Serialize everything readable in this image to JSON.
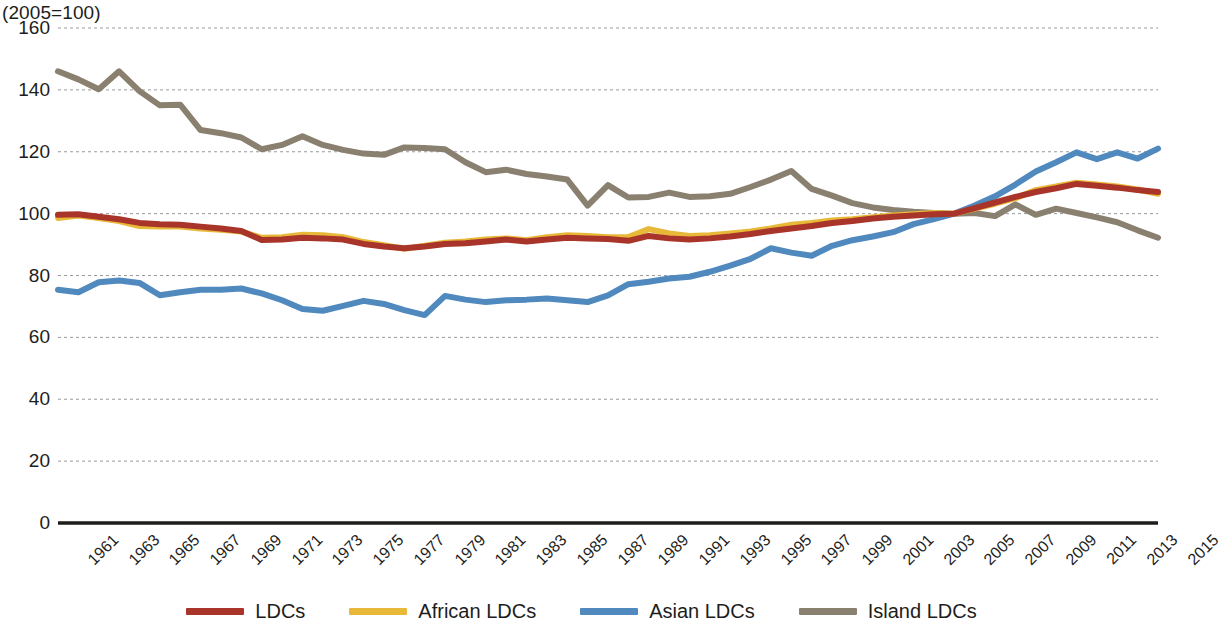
{
  "chart_data": {
    "type": "line",
    "title": "(2005=100)",
    "xlabel": "",
    "ylabel": "",
    "ylim": [
      0,
      160
    ],
    "ytick_step": 20,
    "yticks": [
      160,
      140,
      120,
      100,
      80,
      60,
      40,
      20,
      0
    ],
    "grid": true,
    "grid_style": "dotted-horizontal",
    "legend_position": "bottom-center",
    "x": [
      1961,
      1962,
      1963,
      1964,
      1965,
      1966,
      1967,
      1968,
      1969,
      1970,
      1971,
      1972,
      1973,
      1974,
      1975,
      1976,
      1977,
      1978,
      1979,
      1980,
      1981,
      1982,
      1983,
      1984,
      1985,
      1986,
      1987,
      1988,
      1989,
      1990,
      1991,
      1992,
      1993,
      1994,
      1995,
      1996,
      1997,
      1998,
      1999,
      2000,
      2001,
      2002,
      2003,
      2004,
      2005,
      2006,
      2007,
      2008,
      2009,
      2010,
      2011,
      2012,
      2013,
      2014,
      2015
    ],
    "xtick_labels": [
      1961,
      1963,
      1965,
      1967,
      1969,
      1971,
      1973,
      1975,
      1977,
      1979,
      1981,
      1983,
      1985,
      1987,
      1989,
      1991,
      1993,
      1995,
      1997,
      1999,
      2001,
      2003,
      2005,
      2007,
      2009,
      2011,
      2013,
      2015
    ],
    "series": [
      {
        "name": "LDCs",
        "color": "#A8342A",
        "values": [
          99.6,
          99.8,
          99.0,
          98.2,
          97.0,
          96.6,
          96.4,
          95.8,
          95.2,
          94.4,
          91.5,
          91.6,
          92.2,
          92.0,
          91.6,
          90.2,
          89.4,
          88.8,
          89.4,
          90.2,
          90.4,
          91.0,
          91.6,
          91.0,
          91.6,
          92.2,
          92.0,
          91.8,
          91.2,
          92.8,
          92.0,
          91.6,
          92.0,
          92.6,
          93.4,
          94.4,
          95.2,
          96.0,
          97.0,
          97.6,
          98.4,
          99.0,
          99.4,
          99.8,
          100.0,
          101.8,
          103.6,
          105.4,
          107.0,
          108.2,
          109.6,
          109.0,
          108.4,
          107.6,
          107.0
        ]
      },
      {
        "name": "African LDCs",
        "color": "#E8B838",
        "values": [
          98.6,
          99.4,
          98.6,
          97.6,
          96.0,
          95.8,
          95.8,
          95.2,
          94.8,
          94.2,
          92.2,
          92.4,
          93.2,
          93.0,
          92.4,
          90.8,
          89.8,
          88.6,
          89.6,
          90.6,
          91.0,
          91.6,
          92.0,
          91.4,
          92.4,
          93.0,
          92.8,
          92.4,
          92.4,
          95.0,
          93.6,
          92.8,
          93.0,
          93.6,
          94.2,
          95.2,
          96.4,
          97.0,
          97.8,
          98.2,
          98.8,
          99.4,
          99.8,
          100.2,
          100.0,
          101.6,
          103.2,
          105.0,
          107.6,
          108.8,
          110.0,
          109.4,
          108.8,
          107.8,
          106.4
        ]
      },
      {
        "name": "Asian LDCs",
        "color": "#5089BE",
        "values": [
          75.4,
          74.6,
          77.8,
          78.4,
          77.6,
          73.6,
          74.6,
          75.4,
          75.4,
          75.8,
          74.2,
          72.0,
          69.2,
          68.6,
          70.2,
          71.8,
          70.8,
          68.8,
          67.2,
          73.4,
          72.2,
          71.4,
          72.0,
          72.2,
          72.6,
          72.0,
          71.4,
          73.6,
          77.2,
          78.0,
          79.0,
          79.6,
          81.2,
          83.2,
          85.4,
          88.8,
          87.4,
          86.4,
          89.6,
          91.4,
          92.6,
          94.0,
          96.6,
          98.2,
          100.0,
          102.6,
          105.6,
          109.4,
          113.6,
          116.6,
          119.8,
          117.6,
          119.8,
          117.8,
          121.0
        ]
      },
      {
        "name": "Island LDCs",
        "color": "#8A8070",
        "values": [
          146.0,
          143.4,
          140.2,
          146.0,
          139.6,
          135.0,
          135.2,
          127.0,
          126.0,
          124.6,
          120.8,
          122.2,
          125.0,
          122.2,
          120.6,
          119.4,
          119.0,
          121.4,
          121.2,
          120.8,
          116.6,
          113.4,
          114.2,
          112.8,
          112.0,
          111.0,
          102.6,
          109.2,
          105.2,
          105.4,
          106.8,
          105.4,
          105.6,
          106.4,
          108.6,
          111.0,
          113.8,
          108.0,
          105.8,
          103.4,
          102.0,
          101.2,
          100.6,
          100.2,
          100.0,
          100.2,
          99.2,
          103.0,
          99.6,
          101.6,
          100.2,
          98.8,
          97.2,
          94.6,
          92.2
        ]
      }
    ]
  },
  "legend": {
    "items": [
      {
        "label": "LDCs",
        "color": "#A8342A"
      },
      {
        "label": "African LDCs",
        "color": "#E8B838"
      },
      {
        "label": "Asian LDCs",
        "color": "#5089BE"
      },
      {
        "label": "Island LDCs",
        "color": "#8A8070"
      }
    ]
  },
  "axes": {
    "baseline_color": "#1d1d1b",
    "grid_color": "#9a9a9a"
  }
}
